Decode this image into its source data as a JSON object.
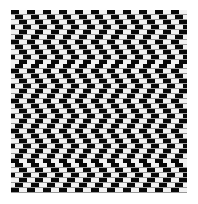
{
  "image": {
    "kind": "optical-illusion-pattern",
    "pattern_name": "cafe-wall-illusion",
    "description": "Dense staggered black-and-white checkerboard of horizontal brick rows with thin grey mortar lines, producing apparent tilt",
    "width": 198,
    "height": 204,
    "background_color": "#ffffff"
  },
  "plate": {
    "left": 11,
    "top": 10,
    "width": 176,
    "height": 183,
    "border_color": "#7a7a7a",
    "border_width": 0
  },
  "colors": {
    "dark_tile": "#080808",
    "light_tile": "#f2f2f2",
    "mortar": "#9a9a9a",
    "mortar_light": "#c8c8c8",
    "page_background": "#ffffff"
  },
  "geometry": {
    "row_count": 37,
    "row_height": 4.95,
    "mortar_height": 0.9,
    "tile_width": 8.0,
    "period_width": 16.0,
    "columns_per_row": 23,
    "stagger_pattern_px": [
      0,
      4,
      8,
      12,
      8,
      4
    ],
    "stagger_cycle_length": 6
  },
  "labels": {
    "figure_caption": ""
  }
}
